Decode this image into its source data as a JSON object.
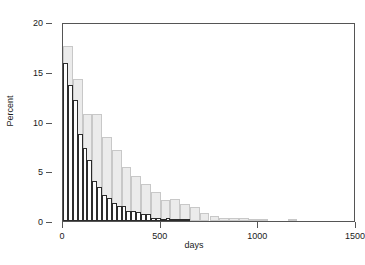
{
  "chart_data": {
    "type": "bar",
    "title": "",
    "subtitle": "",
    "xlabel": "days",
    "ylabel": "Percent",
    "xlim": [
      0,
      1500
    ],
    "ylim": [
      0,
      20
    ],
    "xticks": [
      0,
      500,
      1000,
      1500
    ],
    "yticks": [
      0,
      5,
      10,
      15,
      20
    ],
    "xtick_labels": [
      "0",
      "500",
      "1000",
      "1500"
    ],
    "ytick_labels": [
      "0",
      "5",
      "10",
      "15",
      "20"
    ],
    "grid": false,
    "legend": "none",
    "legend_position": "none",
    "annotations": [],
    "colors": {
      "series_light_fill": "#ebebeb",
      "series_light_edge": "#c8c8c8",
      "series_dark_fill": "#fdfdfd",
      "series_dark_edge": "#2b2b2b",
      "axis": "#555555",
      "text": "#1a1a1a",
      "background": "#ffffff"
    },
    "series": [
      {
        "name": "light-gray-histogram",
        "style": "light",
        "bin_width": 50,
        "bin_starts": [
          0,
          50,
          100,
          150,
          200,
          250,
          300,
          350,
          400,
          450,
          500,
          550,
          600,
          650,
          700,
          750,
          800,
          850,
          900,
          950,
          1000,
          1050,
          1100,
          1150,
          1200,
          1250,
          1300
        ],
        "values": [
          17.6,
          14.3,
          10.8,
          10.8,
          8.4,
          7.1,
          5.4,
          4.5,
          3.7,
          2.9,
          2.1,
          2.2,
          1.7,
          1.4,
          0.8,
          0.5,
          0.3,
          0.3,
          0.3,
          0.1,
          0.2,
          0.0,
          0.0,
          0.1,
          0.0,
          0.0,
          0.0
        ]
      },
      {
        "name": "dark-outline-histogram",
        "style": "dark",
        "bin_width": 25,
        "bin_starts": [
          0,
          25,
          50,
          75,
          100,
          125,
          150,
          175,
          200,
          225,
          250,
          275,
          300,
          325,
          350,
          375,
          400,
          425,
          450,
          475,
          500,
          525,
          550,
          575,
          600,
          625
        ],
        "values": [
          15.9,
          13.7,
          12.2,
          8.7,
          7.3,
          6.1,
          4.0,
          3.4,
          2.6,
          2.3,
          1.8,
          1.5,
          1.5,
          1.0,
          1.0,
          0.9,
          0.7,
          0.7,
          0.3,
          0.3,
          0.2,
          0.3,
          0.2,
          0.1,
          0.1,
          0.1
        ]
      }
    ]
  }
}
